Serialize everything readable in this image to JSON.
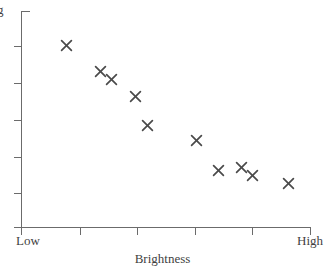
{
  "chart_data": {
    "type": "scatter",
    "title": "",
    "xlabel": "Brightness",
    "ylabel": "Big",
    "grid": false,
    "legend": null,
    "x_tick_labels": [
      "Low",
      "High"
    ],
    "y_tick_labels": [
      "Big",
      "Small"
    ],
    "xlim": [
      "Low",
      "High"
    ],
    "ylim": [
      "Small",
      "Big"
    ],
    "x_axis_category_low": "Low",
    "x_axis_category_high": "High",
    "y_axis_category_low": "Small",
    "y_axis_category_high": "Big",
    "marker": "x",
    "marker_color": "#4a4a4a",
    "axis_color": "#6b6b6b",
    "n_points": 11,
    "relationship": "negative",
    "points": [
      {
        "index": 1,
        "px": 66,
        "py": 45,
        "x": 0.155,
        "y": 0.843
      },
      {
        "index": 2,
        "px": 100,
        "py": 71,
        "x": 0.273,
        "y": 0.722
      },
      {
        "index": 3,
        "px": 111,
        "py": 79,
        "x": 0.311,
        "y": 0.685
      },
      {
        "index": 4,
        "px": 135,
        "py": 96,
        "x": 0.394,
        "y": 0.606
      },
      {
        "index": 5,
        "px": 147,
        "py": 125,
        "x": 0.436,
        "y": 0.472
      },
      {
        "index": 6,
        "px": 196,
        "py": 140,
        "x": 0.605,
        "y": 0.403
      },
      {
        "index": 7,
        "px": 218,
        "py": 170,
        "x": 0.681,
        "y": 0.264
      },
      {
        "index": 8,
        "px": 241,
        "py": 167,
        "x": 0.76,
        "y": 0.278
      },
      {
        "index": 9,
        "px": 252,
        "py": 175,
        "x": 0.798,
        "y": 0.241
      },
      {
        "index": 10,
        "px": 288,
        "py": 183,
        "x": 0.923,
        "y": 0.204
      },
      {
        "index": 11,
        "px": 111,
        "py": 79,
        "x": 0.311,
        "y": 0.685
      }
    ],
    "x_ticks_px": [
      21,
      80,
      137,
      195,
      252,
      310
    ],
    "y_ticks_px": [
      11,
      46,
      83,
      120,
      157,
      193,
      227
    ]
  },
  "axis": {
    "y_top_label": "g",
    "y_bottom_label": "ll",
    "x_left_label": "Low",
    "x_right_label": "High",
    "x_title": "Brightness"
  }
}
